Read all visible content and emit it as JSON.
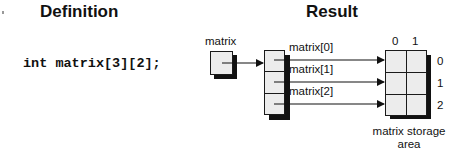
{
  "headings": {
    "definition": "Definition",
    "result": "Result"
  },
  "definition": {
    "code": "int matrix[3][2];"
  },
  "diagram": {
    "pointer_label": "matrix",
    "row_pointer_labels": [
      "matrix[0]",
      "matrix[1]",
      "matrix[2]"
    ],
    "column_indices": [
      "0",
      "1"
    ],
    "row_indices": [
      "0",
      "1",
      "2"
    ],
    "storage_caption_line1": "matrix storage",
    "storage_caption_line2": "area",
    "colors": {
      "cell_fill": "#ececec",
      "border": "#1a1a1a",
      "shadow": "#111111"
    }
  }
}
